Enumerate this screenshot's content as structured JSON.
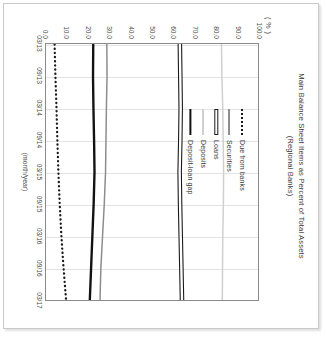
{
  "figure": {
    "title_line1": "Main Balance Sheet Items as Percent of Total Assets",
    "title_line2": "(Regional Banks)",
    "unit_label": "( % )",
    "x_axis_label": "(month/year)"
  },
  "chart_data": {
    "type": "line",
    "title": "Main Balance Sheet Items as Percent of Total Assets (Regional Banks)",
    "xlabel": "(month/year)",
    "ylabel": "( % )",
    "ylim": [
      0.0,
      100.0
    ],
    "grid": "vertical",
    "legend_position": "upper-center-inside",
    "orientation": "rotated-90-clockwise",
    "y_ticks": [
      "100.0",
      "90.0",
      "80.0",
      "70.0",
      "60.0",
      "50.0",
      "40.0",
      "30.0",
      "20.0",
      "10.0",
      "0.0"
    ],
    "y_tick_values": [
      100.0,
      90.0,
      80.0,
      70.0,
      60.0,
      50.0,
      40.0,
      30.0,
      20.0,
      10.0,
      0.0
    ],
    "categories": [
      "03/13",
      "09/13",
      "03/14",
      "09/14",
      "03/15",
      "09/15",
      "03/16",
      "09/16",
      "03/17"
    ],
    "x_tick_labels": [
      "03/13",
      "09/13",
      "03/14",
      "09/14",
      "03/15",
      "09/15",
      "03/16",
      "09/16",
      "03/17"
    ],
    "series": [
      {
        "name": "Due from banks",
        "style": "dotted",
        "color": "#1a1a1a",
        "values": [
          4.2,
          4.6,
          5.1,
          5.5,
          6.0,
          6.6,
          7.4,
          8.4,
          9.6
        ]
      },
      {
        "name": "Securities",
        "style": "solid-gray",
        "color": "#8c8c8c",
        "values": [
          28.8,
          28.9,
          28.6,
          28.4,
          28.2,
          27.6,
          26.8,
          26.0,
          25.6
        ]
      },
      {
        "name": "Loans",
        "style": "hollow-outline",
        "color": "#1a1a1a",
        "values": [
          63.2,
          63.4,
          63.6,
          63.4,
          63.1,
          63.3,
          63.6,
          63.9,
          64.2
        ]
      },
      {
        "name": "Deposits",
        "style": "solid-lightgray",
        "color": "#cfcfcf",
        "values": [
          82.8,
          83.0,
          83.4,
          83.6,
          83.8,
          83.7,
          83.4,
          83.3,
          83.2
        ]
      },
      {
        "name": "Deposit-loan gap",
        "style": "solid-black",
        "color": "#121212",
        "values": [
          22.4,
          22.3,
          22.5,
          22.8,
          23.0,
          22.6,
          22.0,
          21.4,
          20.8
        ]
      }
    ]
  },
  "legend": {
    "items": [
      {
        "label": "Due from banks",
        "key": "dotted-line-key"
      },
      {
        "label": "Securities",
        "key": "gray-line-key"
      },
      {
        "label": "Loans",
        "key": "hollow-line-key"
      },
      {
        "label": "Deposits",
        "key": "lightgray-line-key"
      },
      {
        "label": "Deposit-loan gap",
        "key": "black-line-key"
      }
    ]
  }
}
